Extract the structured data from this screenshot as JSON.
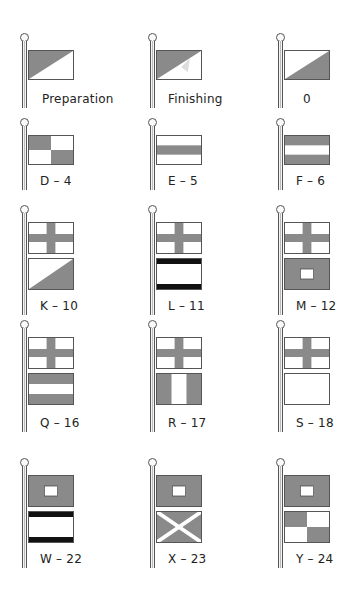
{
  "colors": {
    "flag_fill": "#8a8a8a",
    "flag_white": "#ffffff",
    "outline": "#444444"
  },
  "flags": [
    {
      "label": "Preparation",
      "flags": [
        "diag-upper-left"
      ]
    },
    {
      "label": "Finishing",
      "flags": [
        "diag-upper-left-full"
      ]
    },
    {
      "label": "0",
      "flags": [
        "diag-lower-right"
      ]
    },
    {
      "label": "D – 4",
      "flags": [
        "checker"
      ]
    },
    {
      "label": "E – 5",
      "flags": [
        "stripe-middle"
      ]
    },
    {
      "label": "F – 6",
      "flags": [
        "stripes-outer"
      ]
    },
    {
      "label": "K – 10",
      "flags": [
        "cross",
        "diag-lower-right"
      ]
    },
    {
      "label": "L – 11",
      "flags": [
        "cross",
        "black-bars"
      ]
    },
    {
      "label": "M – 12",
      "flags": [
        "cross",
        "square-center"
      ]
    },
    {
      "label": "Q – 16",
      "flags": [
        "cross",
        "stripes-outer"
      ]
    },
    {
      "label": "R – 17",
      "flags": [
        "cross",
        "vertical-outer"
      ]
    },
    {
      "label": "S – 18",
      "flags": [
        "cross",
        "blank"
      ]
    },
    {
      "label": "W – 22",
      "flags": [
        "square-center",
        "black-bars"
      ]
    },
    {
      "label": "X – 23",
      "flags": [
        "square-center",
        "saltire"
      ]
    },
    {
      "label": "Y – 24",
      "flags": [
        "square-center",
        "checker"
      ]
    }
  ]
}
